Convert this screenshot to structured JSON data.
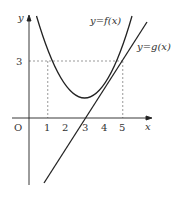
{
  "diagram": {
    "type": "function graph",
    "axes": {
      "x_label": "x",
      "y_label": "y",
      "origin_label": "O"
    },
    "x_ticks": [
      "1",
      "2",
      "3",
      "4",
      "5"
    ],
    "y_ticks": [
      "3"
    ],
    "curves": [
      {
        "label": "y=f(x)",
        "kind": "parabola",
        "roots": [
          2,
          4
        ],
        "vertex": [
          3,
          -1
        ]
      },
      {
        "label": "y=g(x)",
        "kind": "line",
        "points": [
          [
            3,
            0
          ],
          [
            5,
            3
          ]
        ]
      }
    ],
    "intersections": [
      [
        5,
        3
      ]
    ],
    "guides": [
      "x=1 to y=3",
      "x=5 to y=3",
      "y=3 horizontal"
    ]
  }
}
